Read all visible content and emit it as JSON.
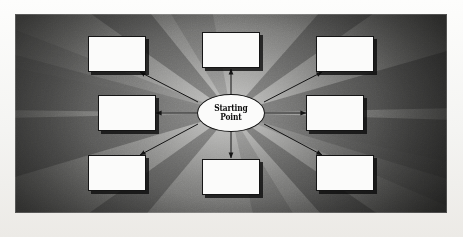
{
  "diagram": {
    "type": "radial-hub-and-spoke",
    "center": {
      "label": "Starting\nPoint",
      "label_line1": "Starting",
      "label_line2": "Point",
      "shape": "ellipse",
      "fill": "#fbfbfa",
      "stroke": "#111111"
    },
    "nodes": [
      {
        "id": "node-top-left",
        "label": "",
        "position": "top-left"
      },
      {
        "id": "node-top-center",
        "label": "",
        "position": "top-center"
      },
      {
        "id": "node-top-right",
        "label": "",
        "position": "top-right"
      },
      {
        "id": "node-middle-left",
        "label": "",
        "position": "middle-left"
      },
      {
        "id": "node-middle-right",
        "label": "",
        "position": "middle-right"
      },
      {
        "id": "node-bottom-left",
        "label": "",
        "position": "bottom-left"
      },
      {
        "id": "node-bottom-center",
        "label": "",
        "position": "bottom-center"
      },
      {
        "id": "node-bottom-right",
        "label": "",
        "position": "bottom-right"
      }
    ],
    "connectors": [
      {
        "from": "center",
        "to": "node-top-left",
        "arrowhead": "end"
      },
      {
        "from": "center",
        "to": "node-top-center",
        "arrowhead": "end"
      },
      {
        "from": "center",
        "to": "node-top-right",
        "arrowhead": "end"
      },
      {
        "from": "center",
        "to": "node-middle-left",
        "arrowhead": "end"
      },
      {
        "from": "center",
        "to": "node-middle-right",
        "arrowhead": "end"
      },
      {
        "from": "center",
        "to": "node-bottom-left",
        "arrowhead": "end"
      },
      {
        "from": "center",
        "to": "node-bottom-center",
        "arrowhead": "end"
      },
      {
        "from": "center",
        "to": "node-bottom-right",
        "arrowhead": "end"
      }
    ],
    "colors": {
      "node_fill": "#fbfbfa",
      "node_stroke": "#151515",
      "node_shadow": "#0a0a0a",
      "connector": "#1a1a1a",
      "panel_center_glow": "#d8d8d6",
      "panel_edge": "#3e3e3c",
      "page_background": "#f4f4f2"
    }
  }
}
